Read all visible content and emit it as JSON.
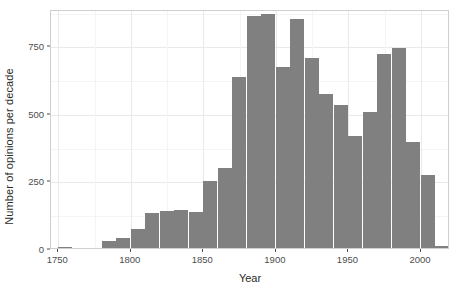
{
  "chart_data": {
    "type": "bar",
    "title": "",
    "subtitle": "",
    "xlabel": "Year",
    "ylabel": "Number of opinions per decade",
    "xlim": [
      1745,
      2020
    ],
    "ylim": [
      0,
      885
    ],
    "grid": true,
    "legend": null,
    "bar_color": "#808080",
    "panel_background": "#ffffff",
    "gridline_color": "#e9e9e9",
    "binwidth": 10,
    "x_ticks": [
      1750,
      1800,
      1850,
      1900,
      1950,
      2000
    ],
    "x_tick_labels": [
      "1750",
      "1800",
      "1850",
      "1900",
      "1950",
      "2000"
    ],
    "y_ticks": [
      0,
      250,
      500,
      750
    ],
    "y_tick_labels": [
      "0",
      "250",
      "500",
      "750"
    ],
    "categories": [
      1750,
      1760,
      1770,
      1780,
      1790,
      1800,
      1810,
      1820,
      1830,
      1840,
      1850,
      1860,
      1870,
      1880,
      1890,
      1900,
      1910,
      1920,
      1930,
      1940,
      1950,
      1960,
      1970,
      1980,
      1990,
      2000,
      2010
    ],
    "values": [
      5,
      0,
      0,
      25,
      38,
      72,
      130,
      138,
      142,
      132,
      247,
      295,
      635,
      858,
      866,
      672,
      848,
      703,
      572,
      530,
      413,
      505,
      719,
      742,
      392,
      272,
      8
    ]
  }
}
